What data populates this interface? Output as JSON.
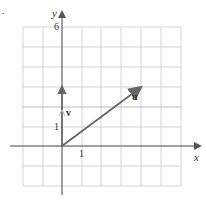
{
  "figure": {
    "marker": ".",
    "axes": {
      "x_label": "x",
      "y_label": "y",
      "x_tick_label": "1",
      "y_tick_label_1": "1",
      "y_tick_label_top": "6",
      "x_range": [
        -2,
        6
      ],
      "y_range": [
        -2,
        6
      ],
      "grid": true
    },
    "vectors": [
      {
        "name": "u",
        "label": "u",
        "from": [
          0,
          0
        ],
        "to": [
          4,
          3
        ]
      },
      {
        "name": "v",
        "label": "v",
        "from": [
          0,
          0
        ],
        "to": [
          0,
          3
        ]
      }
    ],
    "colors": {
      "grid": "#d0d0d0",
      "axis": "#444444",
      "vector": "#666666"
    }
  }
}
